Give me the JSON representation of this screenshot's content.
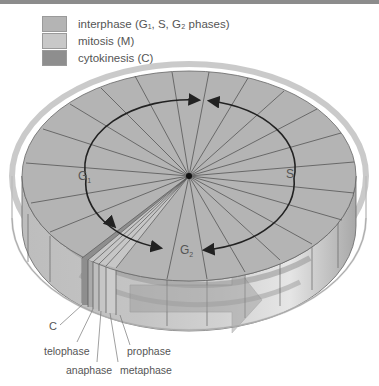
{
  "legend": {
    "items": [
      {
        "label": "interphase (G₁, S, G₂ phases)",
        "color": "#b4b4b4"
      },
      {
        "label": "mitosis (M)",
        "color": "#c8c8c8"
      },
      {
        "label": "cytokinesis (C)",
        "color": "#8e8e8e"
      }
    ]
  },
  "diagram": {
    "phase_labels": {
      "g1": "G",
      "g1_sub": "1",
      "s": "S",
      "g2": "G",
      "g2_sub": "2"
    },
    "callouts": {
      "c": "C",
      "telophase": "telophase",
      "anaphase": "anaphase",
      "prophase": "prophase",
      "metaphase": "metaphase"
    }
  },
  "colors": {
    "interphase": "#b4b4b4",
    "mitosis": "#c8c8c8",
    "cytokinesis": "#8e8e8e",
    "line": "#555555",
    "arrow": "#222222"
  }
}
